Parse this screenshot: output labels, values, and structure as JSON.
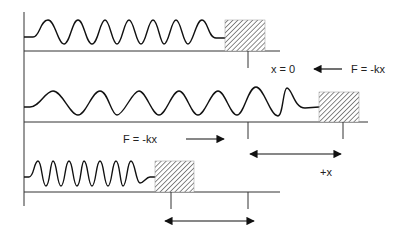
{
  "diagram": {
    "colors": {
      "line": "#222222",
      "hatch": "#777777",
      "background": "#ffffff"
    },
    "labels": {
      "equilibrium": "x = 0",
      "force_top": "F = -kx",
      "force_middle": "F = -kx",
      "displacement": "+x"
    },
    "panels": [
      {
        "name": "equilibrium",
        "spring": "relaxed",
        "force_arrow": "left"
      },
      {
        "name": "stretched",
        "spring": "stretched",
        "force_arrow": "right"
      },
      {
        "name": "compressed",
        "spring": "compressed"
      }
    ]
  }
}
